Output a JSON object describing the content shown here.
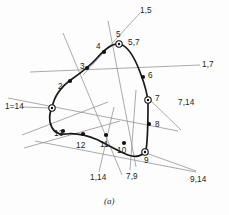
{
  "figure": {
    "caption": "(a)",
    "type": "geometric-diagram"
  },
  "chart_data": {
    "type": "scatter",
    "title": "(a)",
    "xlabel": "",
    "ylabel": "",
    "grid": false,
    "legend": "none",
    "xlim": [
      0,
      229
    ],
    "ylim": [
      0,
      215
    ],
    "curve_path": "M 52 108 C 54 96, 62 86, 72 79 C 82 72, 90 66, 97 58 C 105 49, 112 43, 119 44 C 127 45, 134 56, 140 72 C 145 85, 148 95, 148 104 C 148 120, 148 138, 146 150 C 143 156, 136 158, 128 155 C 118 151, 108 145, 98 140 C 86 135, 74 133, 66 134 C 58 135, 52 131, 50 122 C 49 116, 50 112, 52 108 Z",
    "points": [
      {
        "label": "1=14",
        "marker": "ring",
        "x": 52,
        "y": 108,
        "label_x": 5,
        "label_y": 103,
        "leader": [
          [
            22,
            107
          ],
          [
            50,
            108
          ]
        ]
      },
      {
        "label": "2",
        "marker": "dot",
        "x": 70,
        "y": 81,
        "label_x": 58,
        "label_y": 83
      },
      {
        "label": "3",
        "marker": "dot",
        "x": 87,
        "y": 68,
        "label_x": 80,
        "label_y": 63
      },
      {
        "label": "4",
        "marker": "dot",
        "x": 104,
        "y": 52,
        "label_x": 96,
        "label_y": 43
      },
      {
        "label": "5",
        "marker": "ring",
        "x": 119,
        "y": 44,
        "label_x": 116,
        "label_y": 31
      },
      {
        "label": "6",
        "marker": "dot",
        "x": 143,
        "y": 77,
        "label_x": 148,
        "label_y": 72
      },
      {
        "label": "7",
        "marker": "ring",
        "x": 148,
        "y": 100,
        "label_x": 155,
        "label_y": 95
      },
      {
        "label": "8",
        "marker": "dot",
        "x": 149,
        "y": 124,
        "label_x": 155,
        "label_y": 121
      },
      {
        "label": "9",
        "marker": "ring",
        "x": 145,
        "y": 152,
        "label_x": 144,
        "label_y": 157
      },
      {
        "label": "10",
        "marker": "dot",
        "x": 124,
        "y": 143,
        "label_x": 117,
        "label_y": 147
      },
      {
        "label": "11",
        "marker": "dot",
        "x": 106,
        "y": 135,
        "label_x": 100,
        "label_y": 141
      },
      {
        "label": "12",
        "marker": "dot",
        "x": 83,
        "y": 134,
        "label_x": 76,
        "label_y": 142
      },
      {
        "label": "13",
        "marker": "dot",
        "x": 63,
        "y": 131,
        "label_x": 54,
        "label_y": 130
      }
    ],
    "tangent_lines": [
      {
        "name": "1,5",
        "label": "1,5",
        "x1": 83,
        "y1": 75,
        "x2": 140,
        "y2": 13,
        "label_x": 140,
        "label_y": 7
      },
      {
        "name": "5,7",
        "label": "5,7",
        "x1": 108,
        "y1": 21,
        "x2": 136,
        "y2": 167,
        "label_x": 128,
        "label_y": 39
      },
      {
        "name": "1,7",
        "label": "1,7",
        "x1": 30,
        "y1": 72,
        "x2": 200,
        "y2": 65,
        "label_x": 202,
        "label_y": 61
      },
      {
        "name": "7,14",
        "label": "7,14",
        "x1": 8,
        "y1": 98,
        "x2": 178,
        "y2": 131,
        "label_x": 178,
        "label_y": 99
      },
      {
        "name": "7,9",
        "label": "7,9",
        "x1": 136,
        "y1": 90,
        "x2": 130,
        "y2": 170,
        "label_x": 126,
        "label_y": 173
      },
      {
        "name": "9,14",
        "label": "9,14",
        "x1": 35,
        "y1": 141,
        "x2": 196,
        "y2": 172,
        "label_x": 190,
        "label_y": 176
      },
      {
        "name": "1,14",
        "label": "1,14",
        "x1": 114,
        "y1": 107,
        "x2": 99,
        "y2": 172,
        "label_x": 90,
        "label_y": 174
      }
    ],
    "extra_lines": [
      {
        "name": "line-through-5-7-upper",
        "x1": 63,
        "y1": 33,
        "x2": 122,
        "y2": 175
      },
      {
        "name": "line-1-14-ray-left",
        "x1": 22,
        "y1": 135,
        "x2": 108,
        "y2": 102
      },
      {
        "name": "line-1-14-ray-lower",
        "x1": 24,
        "y1": 148,
        "x2": 120,
        "y2": 121
      },
      {
        "name": "line-7-14-right-tail",
        "x1": 150,
        "y1": 100,
        "x2": 181,
        "y2": 130
      },
      {
        "name": "line-9-14-short",
        "x1": 146,
        "y1": 153,
        "x2": 196,
        "y2": 171
      }
    ]
  }
}
